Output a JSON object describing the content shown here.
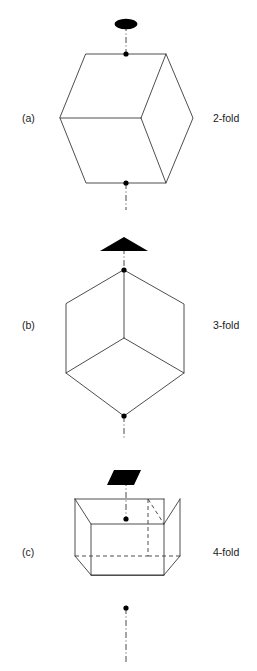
{
  "figure": {
    "width": 257,
    "height": 671,
    "background": "#ffffff",
    "stroke_color": "#3a3a3a",
    "symbol_color": "#000000",
    "text_color": "#1a1a1a"
  },
  "panels": [
    {
      "id": "a",
      "panel_label": "(a)",
      "axis_label": "2-fold",
      "symbol_name": "lens-symbol",
      "symbol_description": "filled ellipse (lens) denoting a 2-fold rotation axis",
      "view": "cube viewed along an edge-to-edge 2-fold axis",
      "outline": "hexagon",
      "hidden_edges": false
    },
    {
      "id": "b",
      "panel_label": "(b)",
      "axis_label": "3-fold",
      "symbol_name": "triangle-symbol",
      "symbol_description": "filled triangle denoting a 3-fold rotation axis",
      "view": "cube viewed down a body-diagonal 3-fold axis",
      "outline": "regular hexagon with central Y",
      "hidden_edges": false
    },
    {
      "id": "c",
      "panel_label": "(c)",
      "axis_label": "4-fold",
      "symbol_name": "square-symbol",
      "symbol_description": "filled parallelogram (square in perspective) denoting a 4-fold rotation axis",
      "view": "cube viewed down a face-centre 4-fold axis, oblique projection",
      "outline": "oblique cube",
      "hidden_edges": true
    }
  ]
}
